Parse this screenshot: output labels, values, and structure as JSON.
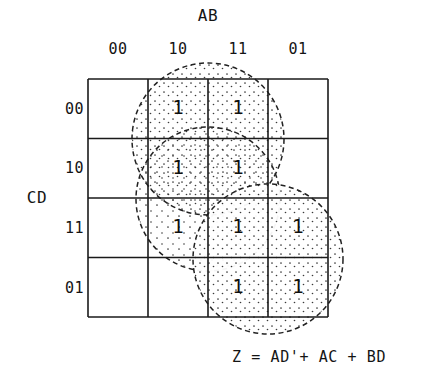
{
  "figure": {
    "type": "karnaugh-map",
    "variables_top": "AB",
    "variables_left": "CD",
    "equation": "Z = AD'+ AC + BD",
    "grid": {
      "cols": 4,
      "rows": 4,
      "x0": 88,
      "y0": 79,
      "cell_w": 60,
      "cell_h": 59.5
    },
    "column_headers": [
      "00",
      "10",
      "11",
      "01"
    ],
    "row_headers": [
      "00",
      "10",
      "11",
      "01"
    ],
    "cells": [
      [
        "",
        "1",
        "1",
        ""
      ],
      [
        "",
        "1",
        "1",
        ""
      ],
      [
        "",
        "1",
        "1",
        "1"
      ],
      [
        "",
        "",
        "1",
        "1"
      ]
    ],
    "groupings": [
      {
        "name": "AD-prime",
        "term": "AD'",
        "cx": 208,
        "cy": 139,
        "r": 76,
        "covers": [
          "r0c1",
          "r0c2",
          "r1c1",
          "r1c2"
        ]
      },
      {
        "name": "AC",
        "term": "AC",
        "cx": 208,
        "cy": 199,
        "r": 72,
        "covers": [
          "r1c1",
          "r1c2",
          "r2c1",
          "r2c2"
        ]
      },
      {
        "name": "BD",
        "term": "BD",
        "cx": 268,
        "cy": 259,
        "r": 75,
        "covers": [
          "r2c2",
          "r2c3",
          "r3c2",
          "r3c3"
        ]
      }
    ],
    "colors": {
      "ink": "#141414",
      "grid_line": "#1a1a1a",
      "circle_line": "#222222",
      "stipple": "#303030",
      "background": "#ffffff"
    }
  }
}
